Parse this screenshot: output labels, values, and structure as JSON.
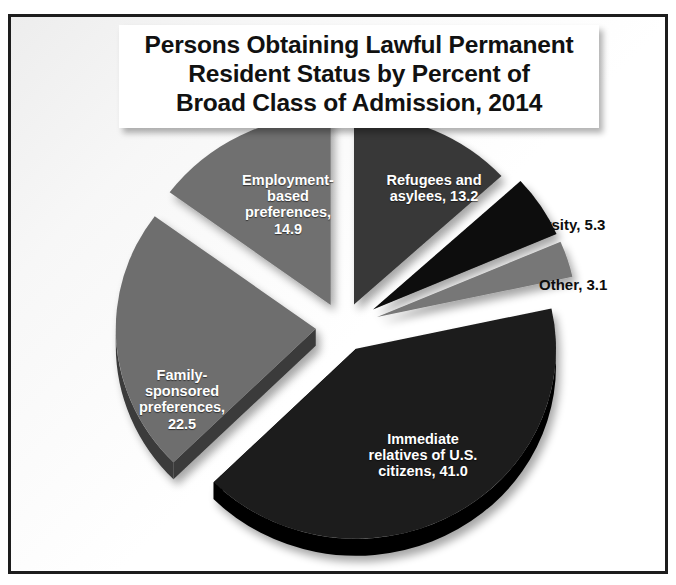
{
  "frame": {
    "border_color": "#1d1d1d",
    "background_color": "#fbfbfb"
  },
  "title": {
    "text": "Persons Obtaining Lawful Permanent\nResident  Status by Percent of\nBroad Class of Admission, 2014",
    "color": "#111111",
    "background_color": "#ffffff"
  },
  "labels": {
    "employment": "Employment-\nbased\npreferences,\n14.9",
    "refugees": "Refugees and\nasylees, 13.2",
    "family": "Family-\nsponsored\npreferences,\n22.5",
    "immediate": "Immediate\nrelatives of U.S.\ncitizens, 41.0",
    "diversity": "Diversity, 5.3",
    "other": "Other, 3.1"
  },
  "chart_data": {
    "type": "pie",
    "title": "Persons Obtaining Lawful Permanent Resident  Status by Percent of Broad Class of Admission, 2014",
    "xlabel": "",
    "ylabel": "",
    "units": "percent",
    "exploded": true,
    "three_d": true,
    "legend": "none",
    "labels_on_slices": true,
    "total": 100.0,
    "categories": [
      "Refugees and asylees",
      "Diversity",
      "Other",
      "Immediate relatives of U.S. citizens",
      "Family-sponsored preferences",
      "Employment-based preferences"
    ],
    "values": [
      13.2,
      5.3,
      3.1,
      41.0,
      22.5,
      14.9
    ],
    "slices": [
      {
        "name": "Refugees and asylees",
        "value": 13.2,
        "label": "Refugees and asylees, 13.2",
        "color": "#393939",
        "side_color": "#141414",
        "label_color": "#ffffff",
        "label_position": "inside",
        "start_angle": 0.0,
        "end_angle": 47.52
      },
      {
        "name": "Diversity",
        "value": 5.3,
        "label": "Diversity, 5.3",
        "color": "#080808",
        "side_color": "#000000",
        "label_color": "#0d0d0d",
        "label_position": "outside",
        "start_angle": 47.52,
        "end_angle": 66.6
      },
      {
        "name": "Other",
        "value": 3.1,
        "label": "Other, 3.1",
        "color": "#777777",
        "side_color": "#4a4a4a",
        "label_color": "#0d0d0d",
        "label_position": "outside",
        "start_angle": 66.6,
        "end_angle": 77.76
      },
      {
        "name": "Immediate relatives of U.S. citizens",
        "value": 41.0,
        "label": "Immediate relatives of U.S. citizens, 41.0",
        "color": "#1b1b1b",
        "side_color": "#000000",
        "label_color": "#ffffff",
        "label_position": "inside",
        "start_angle": 77.76,
        "end_angle": 225.36
      },
      {
        "name": "Family-sponsored preferences",
        "value": 22.5,
        "label": "Family-sponsored preferences, 22.5",
        "color": "#6e6e6e",
        "side_color": "#3a3a3a",
        "label_color": "#ffffff",
        "label_position": "inside",
        "start_angle": 225.36,
        "end_angle": 306.36
      },
      {
        "name": "Employment-based preferences",
        "value": 14.9,
        "label": "Employment-based preferences, 14.9",
        "color": "#707070",
        "side_color": "#171717",
        "label_color": "#ffffff",
        "label_position": "inside",
        "start_angle": 306.36,
        "end_angle": 360.0
      }
    ]
  }
}
